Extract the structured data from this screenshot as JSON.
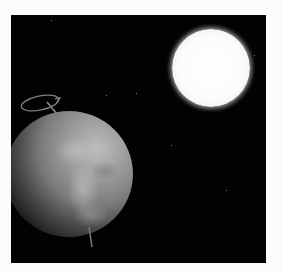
{
  "scene": {
    "description": "Earth with rotation axis arrow and the Sun in space",
    "background_color": "#fbfbfb",
    "space_color": "#020202",
    "sun": {
      "label": "sun",
      "color": "#ffffff"
    },
    "earth": {
      "label": "earth",
      "color": "#8a8a8a"
    },
    "rotation_axis": {
      "label": "rotation-axis",
      "color": "#8c8c8c"
    }
  }
}
